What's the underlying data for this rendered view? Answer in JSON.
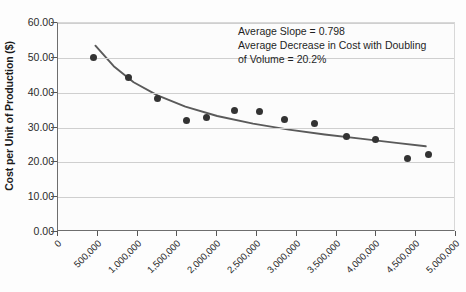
{
  "chart_data": {
    "type": "scatter",
    "title": "",
    "xlabel": "",
    "ylabel": "Cost per Unit of Production ($)",
    "xlim": [
      0,
      5000000
    ],
    "ylim": [
      0,
      60
    ],
    "grid": true,
    "legend": "none",
    "x_tick_labels": [
      "0",
      "500,000",
      "1,000,000",
      "1,500,000",
      "2,000,000",
      "2,500,000",
      "3,000,000",
      "3,500,000",
      "4,000,000",
      "4,500,000",
      "5,000,000"
    ],
    "x_ticks": [
      0,
      500000,
      1000000,
      1500000,
      2000000,
      2500000,
      3000000,
      3500000,
      4000000,
      4500000,
      5000000
    ],
    "y_tick_labels": [
      "0.00",
      "10.00",
      "20.00",
      "30.00",
      "40.00",
      "50.00",
      "60.00"
    ],
    "y_ticks": [
      0,
      10,
      20,
      30,
      40,
      50,
      60
    ],
    "series": [
      {
        "name": "Cost per Unit",
        "marker": "circle",
        "color": "#333333",
        "x": [
          440000,
          880000,
          1250000,
          1620000,
          1870000,
          2220000,
          2530000,
          2850000,
          3220000,
          3620000,
          3990000,
          4390000,
          4660000
        ],
        "y": [
          50.0,
          44.3,
          38.2,
          32.0,
          33.0,
          35.0,
          34.6,
          32.4,
          31.2,
          27.3,
          26.6,
          21.0,
          22.2
        ]
      },
      {
        "name": "Power trend line",
        "type": "line",
        "color": "#5a5a5a",
        "x": [
          470000,
          700000,
          950000,
          1250000,
          1600000,
          2000000,
          2450000,
          2900000,
          3350000,
          3800000,
          4250000,
          4620000
        ],
        "y": [
          53.5,
          47.6,
          43.0,
          39.2,
          36.0,
          33.3,
          31.1,
          29.4,
          28.0,
          26.8,
          25.6,
          24.6
        ]
      }
    ],
    "annotations": [
      "Average Slope = 0.798",
      "Average Decrease in Cost with Doubling",
      "of Volume = 20.2%"
    ]
  }
}
